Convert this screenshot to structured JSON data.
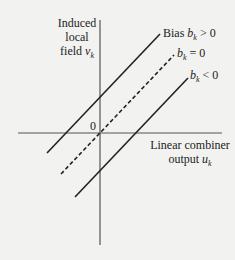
{
  "y_axis_label": {
    "line1": "Induced",
    "line2": "local",
    "line3_text": "field ",
    "line3_var": "v",
    "line3_sub": "k"
  },
  "x_axis_label": {
    "line1": "Linear combiner",
    "line2_text": "output ",
    "line2_var": "u",
    "line2_sub": "k"
  },
  "origin_label": "0",
  "lines": [
    {
      "prefix": "Bias ",
      "var": "b",
      "sub": "k",
      "relation": " > 0",
      "style": "solid"
    },
    {
      "prefix": "",
      "var": "b",
      "sub": "k",
      "relation": " = 0",
      "style": "dashed"
    },
    {
      "prefix": "",
      "var": "b",
      "sub": "k",
      "relation": " < 0",
      "style": "solid"
    }
  ],
  "colors": {
    "line": "#222222",
    "axis": "#444444",
    "background": "#f2f2f0"
  }
}
